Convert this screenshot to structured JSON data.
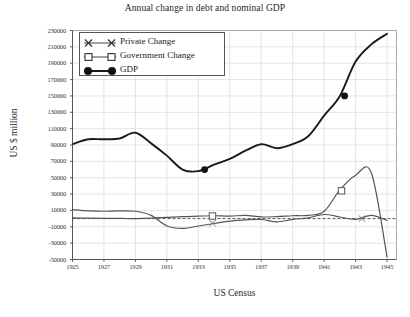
{
  "chart_data": {
    "type": "line",
    "title": "Annual change in debt and nominal GDP",
    "xlabel": "US Census",
    "ylabel": "US $ million",
    "xlim": [
      1925,
      1945.6
    ],
    "ylim": [
      -50000,
      230000
    ],
    "ytick_step": 20000,
    "grid": true,
    "legend_position": "top-left-inside",
    "zero_reference_line": 0,
    "xticks": [
      "1925",
      "1927",
      "1929",
      "1931",
      "1933",
      "1935",
      "1937",
      "1939",
      "1941",
      "1943",
      "1945"
    ],
    "yticks": [
      "230000",
      "210000",
      "190000",
      "170000",
      "150000",
      "130000",
      "110000",
      "90000",
      "70000",
      "50000",
      "30000",
      "10000",
      "-10000",
      "-30000",
      "-50000"
    ],
    "x": [
      1925,
      1926,
      1927,
      1928,
      1929,
      1930,
      1931,
      1932,
      1933,
      1934,
      1935,
      1936,
      1937,
      1938,
      1939,
      1940,
      1941,
      1942,
      1943,
      1944,
      1945
    ],
    "series": [
      {
        "name": "Private Change",
        "marker": "x",
        "color": "#555555",
        "values": [
          11000,
          9500,
          9000,
          9500,
          9000,
          4000,
          -9000,
          -12000,
          -9000,
          -6000,
          -3000,
          -1500,
          -1000,
          -4000,
          -1000,
          1000,
          5000,
          2000,
          -1000,
          4000,
          -2000
        ]
      },
      {
        "name": "Government Change",
        "marker": "square",
        "color": "#555555",
        "values": [
          1000,
          500,
          300,
          200,
          100,
          500,
          1500,
          2500,
          3000,
          3500,
          3000,
          4000,
          2000,
          2500,
          3500,
          4000,
          9000,
          35000,
          53000,
          56000,
          -47000
        ]
      },
      {
        "name": "GDP",
        "marker": "circle-filled",
        "color": "#1a1a1a",
        "values": [
          91000,
          97000,
          97000,
          98000,
          105000,
          92000,
          77000,
          60000,
          58000,
          66000,
          73000,
          83000,
          91000,
          86000,
          91000,
          101000,
          126000,
          150000,
          192000,
          213000,
          226000
        ]
      }
    ],
    "highlighted_markers": [
      {
        "series": "GDP",
        "x": 1933.4,
        "y": 60000
      },
      {
        "series": "GDP",
        "x": 1942.3,
        "y": 150000
      },
      {
        "series": "Government Change",
        "x": 1933.9,
        "y": 3200
      },
      {
        "series": "Government Change",
        "x": 1942.1,
        "y": 34000
      },
      {
        "series": "Private Change",
        "x": 1933.9,
        "y": -5500
      },
      {
        "series": "Private Change",
        "x": 1943.4,
        "y": 0
      }
    ]
  },
  "legend": {
    "items": [
      {
        "label": "Private  Change"
      },
      {
        "label": "Government Change"
      },
      {
        "label": "GDP"
      }
    ]
  },
  "caption": {
    "text": ""
  }
}
